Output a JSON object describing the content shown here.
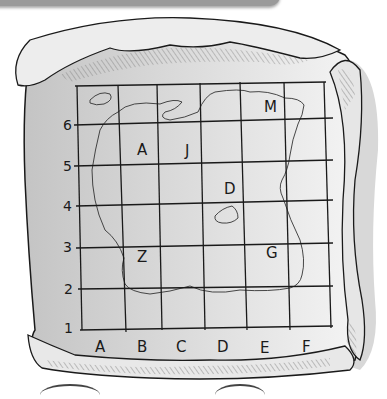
{
  "map": {
    "columns": [
      "A",
      "B",
      "C",
      "D",
      "E",
      "F"
    ],
    "rows": [
      "1",
      "2",
      "3",
      "4",
      "5",
      "6"
    ],
    "markers": [
      {
        "label": "M",
        "col": "E",
        "row": "6"
      },
      {
        "label": "A",
        "col": "B",
        "row": "5"
      },
      {
        "label": "J",
        "col": "C",
        "row": "5"
      },
      {
        "label": "D",
        "col": "D",
        "row": "4"
      },
      {
        "label": "G",
        "col": "E",
        "row": "3"
      },
      {
        "label": "Z",
        "col": "B",
        "row": "3"
      }
    ]
  },
  "colors": {
    "ink": "#1a1a1a",
    "parchment": "#f2f2f2",
    "shadow": "#c9c9c9",
    "topbar": "#9a9a9a"
  }
}
